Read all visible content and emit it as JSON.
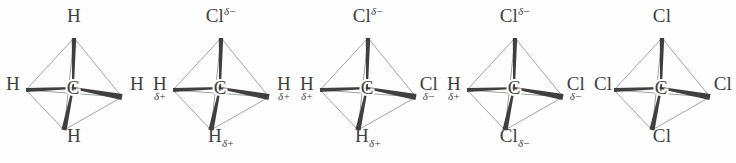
{
  "figure": {
    "background_color": "#fefefe",
    "bond_color": "#3f3f3f",
    "outline_color": "#8a8a8a",
    "label_color": "#3f3f3f",
    "center_atom": "C",
    "charge_delta_negative": "δ−",
    "charge_delta_positive": "δ+"
  },
  "chart_data": {
    "type": "diagram",
    "title": "",
    "subtitle": "",
    "molecules": [
      {
        "name": "methane",
        "center": "C",
        "x": 0,
        "substituents": [
          {
            "position": "top",
            "symbol": "H",
            "charge": "",
            "charge_style": "none"
          },
          {
            "position": "left",
            "symbol": "H",
            "charge": "",
            "charge_style": "none"
          },
          {
            "position": "right",
            "symbol": "H",
            "charge": "",
            "charge_style": "none"
          },
          {
            "position": "bottom",
            "symbol": "H",
            "charge": "",
            "charge_style": "none"
          }
        ]
      },
      {
        "name": "chloromethane",
        "center": "C",
        "x": 147,
        "substituents": [
          {
            "position": "top",
            "symbol": "Cl",
            "charge": "δ−",
            "charge_style": "superscript"
          },
          {
            "position": "left",
            "symbol": "H",
            "charge": "δ+",
            "charge_style": "below"
          },
          {
            "position": "right",
            "symbol": "H",
            "charge": "δ+",
            "charge_style": "below"
          },
          {
            "position": "bottom",
            "symbol": "H",
            "charge": "δ+",
            "charge_style": "subscript"
          }
        ]
      },
      {
        "name": "dichloromethane",
        "center": "C",
        "x": 294,
        "substituents": [
          {
            "position": "top",
            "symbol": "Cl",
            "charge": "δ−",
            "charge_style": "superscript"
          },
          {
            "position": "left",
            "symbol": "H",
            "charge": "δ+",
            "charge_style": "below"
          },
          {
            "position": "right",
            "symbol": "Cl",
            "charge": "δ−",
            "charge_style": "below"
          },
          {
            "position": "bottom",
            "symbol": "H",
            "charge": "δ+",
            "charge_style": "subscript"
          }
        ]
      },
      {
        "name": "trichloromethane",
        "center": "C",
        "x": 441,
        "substituents": [
          {
            "position": "top",
            "symbol": "Cl",
            "charge": "δ−",
            "charge_style": "superscript"
          },
          {
            "position": "left",
            "symbol": "H",
            "charge": "δ+",
            "charge_style": "below"
          },
          {
            "position": "right",
            "symbol": "Cl",
            "charge": "δ−",
            "charge_style": "below"
          },
          {
            "position": "bottom",
            "symbol": "Cl",
            "charge": "δ−",
            "charge_style": "subscript"
          }
        ]
      },
      {
        "name": "tetrachloromethane",
        "center": "C",
        "x": 588,
        "substituents": [
          {
            "position": "top",
            "symbol": "Cl",
            "charge": "",
            "charge_style": "none"
          },
          {
            "position": "left",
            "symbol": "Cl",
            "charge": "",
            "charge_style": "none"
          },
          {
            "position": "right",
            "symbol": "Cl",
            "charge": "",
            "charge_style": "none"
          },
          {
            "position": "bottom",
            "symbol": "Cl",
            "charge": "",
            "charge_style": "none"
          }
        ]
      }
    ]
  }
}
